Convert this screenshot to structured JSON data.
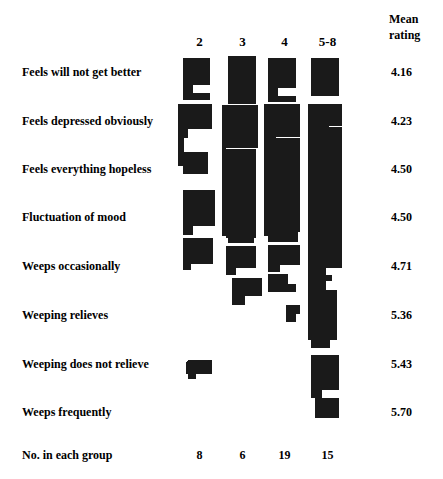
{
  "figure": {
    "title": "",
    "bar_color": "#1a1a1a",
    "background": "#ffffff"
  },
  "columns": {
    "header_labels": [
      "2",
      "3",
      "4",
      "5-8"
    ],
    "group_counts": [
      "8",
      "6",
      "19",
      "15"
    ],
    "counts_row_label": "No. in each group"
  },
  "mean_column": {
    "header_line1": "Mean",
    "header_line2": "rating"
  },
  "rows": [
    {
      "label": "Feels will not get better",
      "mean": "4.16"
    },
    {
      "label": "Feels depressed obviously",
      "mean": "4.23"
    },
    {
      "label": "Feels everything hopeless",
      "mean": "4.50"
    },
    {
      "label": "Fluctuation of mood",
      "mean": "4.50"
    },
    {
      "label": "Weeps occasionally",
      "mean": "4.71"
    },
    {
      "label": "Weeping relieves",
      "mean": "5.36"
    },
    {
      "label": "Weeping does not relieve",
      "mean": "5.43"
    },
    {
      "label": "Weeps frequently",
      "mean": "5.70"
    }
  ],
  "chart_data": {
    "type": "bar",
    "title": "",
    "xlabel": "",
    "ylabel": "",
    "orientation": "stacked-vertical-profile",
    "categories": [
      "Feels will not get better",
      "Feels depressed obviously",
      "Feels everything hopeless",
      "Fluctuation of mood",
      "Weeps occasionally",
      "Weeping relieves",
      "Weeping does not relieve",
      "Weeps frequently"
    ],
    "group_labels": [
      "2",
      "3",
      "4",
      "5-8"
    ],
    "group_counts": [
      8,
      6,
      19,
      15
    ],
    "mean_ratings": [
      4.16,
      4.23,
      4.5,
      4.5,
      4.71,
      5.36,
      5.43,
      5.7
    ],
    "note": "Each group column is a stacked profile; segment width = proportion of that group endorsing the symptom (1.0 = full column width). Segment vertical extent follows the row bands.",
    "series": [
      {
        "name": "2",
        "values": [
          0.78,
          1.0,
          0.0,
          0.9,
          0.9,
          0.0,
          0.0,
          0.0
        ]
      },
      {
        "name": "3",
        "values": [
          0.62,
          1.0,
          1.0,
          1.0,
          0.72,
          0.66,
          0.0,
          0.0
        ]
      },
      {
        "name": "4",
        "values": [
          0.72,
          1.0,
          1.0,
          1.0,
          0.74,
          0.62,
          0.0,
          0.0
        ]
      },
      {
        "name": "5-8",
        "values": [
          0.68,
          1.0,
          0.62,
          1.0,
          1.0,
          1.0,
          0.8,
          0.7
        ]
      }
    ],
    "grid": false,
    "legend": "none"
  },
  "shapes": {
    "col_x": [
      183,
      226,
      268,
      311
    ],
    "col_w": 33,
    "polys": [
      {
        "group": "2",
        "points": "183,58 210,58 210,85 193,85 193,93 210,93 210,100 183,100"
      },
      {
        "group": "2",
        "points": "178,104 212,104 212,129 188,129 188,138 184,138 184,152 208,152 208,174 183,174 183,166 178,166"
      },
      {
        "group": "2",
        "points": "183,190 215,190 215,226 193,226 193,235 183,235"
      },
      {
        "group": "2",
        "points": "183,238 213,238 213,264 191,264 191,270 183,270"
      },
      {
        "group": "2",
        "points": "186,363 188,360 212,360 212,374 196,374 196,379 188,379 188,374 186,374"
      },
      {
        "group": "3",
        "points": "228,56 256,56 256,104 228,104"
      },
      {
        "group": "3",
        "points": "222,105 258,105 258,148 226,148 226,238 254,238 254,243 228,243 228,236 222,236"
      },
      {
        "group": "3",
        "points": "226,149 256,149 256,238 226,238"
      },
      {
        "group": "3",
        "points": "226,246 256,246 256,268 236,268 236,275 226,275"
      },
      {
        "group": "3",
        "points": "232,278 262,278 262,296 245,296 245,305 232,305"
      },
      {
        "group": "4",
        "points": "268,58 296,58 296,88 278,88 278,96 296,96 296,102 268,102"
      },
      {
        "group": "4",
        "points": "264,104 300,104 300,137 276,137 276,232 298,232 298,242 268,242 268,236 264,236"
      },
      {
        "group": "4",
        "points": "276,138 300,138 300,232 276,232"
      },
      {
        "group": "4",
        "points": "268,245 300,245 300,265 280,265 280,272 268,272"
      },
      {
        "group": "4",
        "points": "268,274 288,274 288,284 296,284 296,292 268,292"
      },
      {
        "group": "4",
        "points": "286,305 300,305 300,314 296,314 296,322 286,322"
      },
      {
        "group": "5-8",
        "points": "311,58 339,58 339,96 311,96"
      },
      {
        "group": "5-8",
        "points": "308,104 342,104 342,126 329,126 329,133 334,133 334,140 329,140 329,148 336,148 336,160 329,160 329,168 342,168 342,268 326,268 326,275 332,275 332,281 326,281 326,290 337,290 337,340 330,340 330,348 311,348 311,340 308,340"
      },
      {
        "group": "5-8",
        "points": "329,127 342,127 342,168 329,168"
      },
      {
        "group": "5-8",
        "points": "311,355 339,355 339,390 322,390 322,398 339,398 339,418 315,418 315,398 311,398"
      }
    ]
  }
}
